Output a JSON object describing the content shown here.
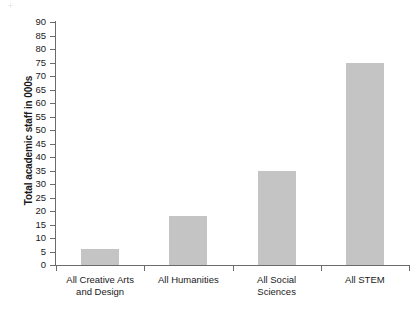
{
  "chart_data": {
    "type": "bar",
    "title": "",
    "subtitle": "",
    "xlabel": "",
    "ylabel": "Total academic staff in 000s",
    "categories": [
      "All Creative Arts\nand Design",
      "All Humanities",
      "All Social\nSciences",
      "All STEM"
    ],
    "values": [
      6,
      18,
      35,
      75
    ],
    "ylim": [
      0,
      90
    ],
    "ytick_step": 5,
    "ytick_labels": [
      "90",
      "85",
      "80",
      "75",
      "70",
      "65",
      "60",
      "55",
      "50",
      "45",
      "40",
      "35",
      "30",
      "25",
      "20",
      "15",
      "10",
      "5",
      "0"
    ],
    "grid": false,
    "legend": null,
    "series": [
      {
        "name": "Total academic staff in 000s",
        "values": [
          6,
          18,
          35,
          75
        ]
      }
    ]
  },
  "style": {
    "bar_color": "#c4c4c4",
    "axis_color": "#6b6b6b",
    "text_color": "#1a1a1a",
    "background": "#ffffff"
  }
}
